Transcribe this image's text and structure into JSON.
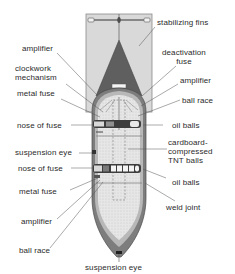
{
  "diagram": {
    "colors": {
      "fin_fill": "#d8d8d8",
      "fin_outline": "#8a8a8a",
      "cone_fill": "#5e5e5e",
      "casing_fill": "#7a7a7a",
      "casing_inner": "#b9b9b9",
      "charge_fill": "#e4e4e4",
      "fuse_fill": "#3a3a3a",
      "leader_line": "#555555",
      "text": "#2b2b2b"
    }
  },
  "labels": {
    "stabilizing_fins": "stabilizing fins",
    "amplifier_top_left": "amplifier",
    "deactivation_fuse": "deactivation\nfuse",
    "clockwork_mechanism": "clockwork\nmechanism",
    "amplifier_top_right": "amplifier",
    "metal_fuse_top": "metal fuse",
    "ball_race_top": "ball race",
    "nose_of_fuse_top": "nose of fuse",
    "oil_balls_top": "oil balls",
    "suspension_eye_side": "suspension eye",
    "cardboard_tnt": "cardboard-\ncompressed\nTNT balls",
    "nose_of_fuse_bottom": "nose of fuse",
    "oil_balls_bottom": "oil balls",
    "metal_fuse_bottom": "metal fuse",
    "weld_joint": "weld joint",
    "amplifier_bottom": "amplifier",
    "ball_race_bottom": "ball race",
    "suspension_eye_bottom": "suspension eye"
  }
}
